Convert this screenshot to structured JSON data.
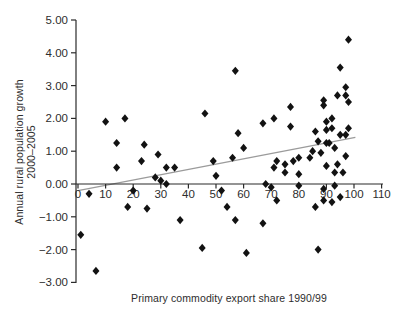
{
  "figure": {
    "y_axis_title_line1": "Annual rural population growth",
    "y_axis_title_line2": "2000–2005",
    "x_axis_title": "Primary commodity export share 1990/99"
  },
  "chart_data": {
    "type": "scatter",
    "title": "",
    "xlabel": "Primary commodity export share 1990/99",
    "ylabel": "Annual rural population growth 2000–2005",
    "xlim": [
      0,
      110
    ],
    "ylim": [
      -3,
      5
    ],
    "x_ticks": [
      0,
      10,
      20,
      30,
      40,
      50,
      60,
      70,
      80,
      90,
      100,
      110
    ],
    "y_ticks": [
      -3,
      -2,
      -1,
      0,
      1,
      2,
      3,
      4,
      5
    ],
    "grid": false,
    "legend": "none",
    "marker": {
      "shape": "diamond",
      "color": "#121212",
      "size": 8
    },
    "axis_color": "#2b2b2b",
    "tick_label_color": "#2d2d2d",
    "trendline": {
      "x1": 0,
      "y1": -0.2,
      "x2": 100.5,
      "y2": 1.42,
      "color": "#9b9b9b"
    },
    "points": [
      [
        1,
        -1.55
      ],
      [
        4,
        -0.3
      ],
      [
        6.5,
        -2.65
      ],
      [
        10,
        1.9
      ],
      [
        14,
        1.25
      ],
      [
        14,
        0.5
      ],
      [
        17,
        2.0
      ],
      [
        20,
        -0.2
      ],
      [
        18,
        -0.7
      ],
      [
        25,
        -0.75
      ],
      [
        23,
        0.7
      ],
      [
        24,
        1.2
      ],
      [
        28,
        0.2
      ],
      [
        29,
        0.9
      ],
      [
        30,
        0.1
      ],
      [
        32,
        0.0
      ],
      [
        32,
        0.5
      ],
      [
        35,
        0.5
      ],
      [
        37,
        -1.1
      ],
      [
        45,
        -1.95
      ],
      [
        46,
        2.15
      ],
      [
        49,
        0.7
      ],
      [
        50,
        0.25
      ],
      [
        52,
        -0.2
      ],
      [
        54,
        -0.7
      ],
      [
        56,
        0.8
      ],
      [
        57,
        3.45
      ],
      [
        58,
        1.55
      ],
      [
        57,
        -1.1
      ],
      [
        60,
        1.1
      ],
      [
        61,
        -2.1
      ],
      [
        67,
        1.85
      ],
      [
        67,
        -1.2
      ],
      [
        68,
        0.0
      ],
      [
        70,
        -0.1
      ],
      [
        71,
        2.0
      ],
      [
        71,
        0.5
      ],
      [
        72,
        0.7
      ],
      [
        72,
        -0.5
      ],
      [
        75,
        0.6
      ],
      [
        75,
        0.35
      ],
      [
        77,
        2.35
      ],
      [
        77,
        1.75
      ],
      [
        78,
        0.7
      ],
      [
        80,
        0.8
      ],
      [
        80,
        0.3
      ],
      [
        80,
        -0.05
      ],
      [
        84,
        0.8
      ],
      [
        85,
        1.0
      ],
      [
        86,
        1.6
      ],
      [
        86,
        -0.7
      ],
      [
        87,
        1.3
      ],
      [
        87,
        -2.0
      ],
      [
        88,
        0.95
      ],
      [
        89,
        2.55
      ],
      [
        89,
        2.4
      ],
      [
        89,
        -0.15
      ],
      [
        89,
        -0.5
      ],
      [
        90,
        1.9
      ],
      [
        90,
        1.65
      ],
      [
        90,
        1.25
      ],
      [
        90,
        0.55
      ],
      [
        91,
        1.25
      ],
      [
        92,
        2.0
      ],
      [
        92,
        1.7
      ],
      [
        92,
        -0.55
      ],
      [
        93,
        1.1
      ],
      [
        93,
        0.35
      ],
      [
        93,
        -0.05
      ],
      [
        94,
        2.7
      ],
      [
        94,
        0.6
      ],
      [
        95,
        3.55
      ],
      [
        95,
        1.5
      ],
      [
        95,
        -0.4
      ],
      [
        96,
        0.35
      ],
      [
        97,
        2.95
      ],
      [
        97,
        2.7
      ],
      [
        97,
        1.5
      ],
      [
        97,
        0.85
      ],
      [
        98,
        4.4
      ],
      [
        98,
        2.5
      ],
      [
        98,
        1.7
      ]
    ]
  }
}
